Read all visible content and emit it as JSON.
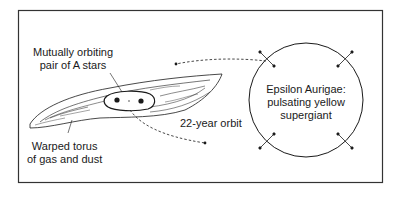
{
  "labels": {
    "binary": [
      "Mutually orbiting",
      "pair of A stars"
    ],
    "torus": [
      "Warped torus",
      "of gas and dust"
    ],
    "orbit": "22-year orbit",
    "supergiant": [
      "Epsilon Aurigae:",
      "pulsating yellow",
      "supergiant"
    ]
  },
  "colors": {
    "line": "#1a1a1a",
    "frame": "#333333",
    "background": "#ffffff"
  },
  "icons": {
    "pulsation_arrows": "double-headed-arrow-icon",
    "orbit_arrow": "dashed-arrow-icon",
    "star": "filled-dot-icon"
  }
}
